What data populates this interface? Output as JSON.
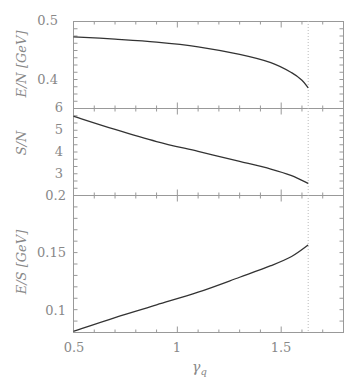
{
  "chart_data": [
    {
      "type": "line",
      "title": "",
      "xlabel": "γq",
      "ylabel": "E/N [GeV]",
      "xlim": [
        0.5,
        1.8
      ],
      "ylim": [
        0.352,
        0.5
      ],
      "yticks": [
        "0.5",
        "0.4"
      ],
      "grid": false,
      "series": [
        {
          "name": "E/N",
          "x": [
            0.5,
            0.7,
            0.9,
            1.1,
            1.3,
            1.45,
            1.55,
            1.6,
            1.63
          ],
          "values": [
            0.474,
            0.47,
            0.465,
            0.457,
            0.444,
            0.43,
            0.413,
            0.4,
            0.387
          ]
        }
      ]
    },
    {
      "type": "line",
      "xlabel": "γq",
      "ylabel": "S/N",
      "xlim": [
        0.5,
        1.8
      ],
      "ylim": [
        2.05,
        6
      ],
      "yticks": [
        "6",
        "5",
        "4",
        "3"
      ],
      "series": [
        {
          "name": "S/N",
          "x": [
            0.5,
            0.7,
            0.9,
            1.1,
            1.3,
            1.45,
            1.55,
            1.63
          ],
          "values": [
            5.65,
            5.05,
            4.5,
            4.05,
            3.6,
            3.25,
            2.95,
            2.6
          ]
        }
      ]
    },
    {
      "type": "line",
      "xlabel": "γq",
      "ylabel": "E/S [GeV]",
      "xlim": [
        0.5,
        1.8
      ],
      "ylim": [
        0.081,
        0.2
      ],
      "yticks": [
        "0.2",
        "0.15",
        "0.1"
      ],
      "xticks": [
        "0.5",
        "1",
        "1.5"
      ],
      "series": [
        {
          "name": "E/S",
          "x": [
            0.5,
            0.7,
            0.9,
            1.1,
            1.3,
            1.45,
            1.55,
            1.63
          ],
          "values": [
            0.082,
            0.094,
            0.105,
            0.116,
            0.129,
            0.139,
            0.147,
            0.157
          ]
        }
      ]
    }
  ],
  "annotations": {
    "vertical_dotted_line_x": 1.63
  },
  "labels": {
    "top_ylabel": "E/N [GeV]",
    "mid_ylabel": "S/N",
    "bot_ylabel": "E/S [GeV]",
    "xlabel": "γ",
    "xlabel_sub": "q",
    "top_ticks": [
      "0.5",
      "0.4"
    ],
    "mid_ticks": [
      "6",
      "5",
      "4",
      "3"
    ],
    "bot_ticks": [
      "0.2",
      "0.15",
      "0.1"
    ],
    "x_ticks": [
      "0.5",
      "1",
      "1.5"
    ]
  }
}
